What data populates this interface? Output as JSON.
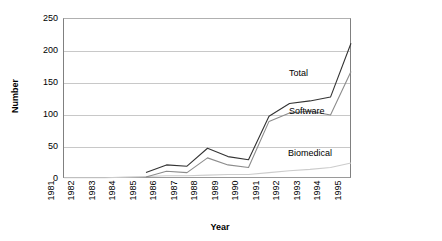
{
  "chart_data": {
    "type": "line",
    "title": "",
    "xlabel": "Year",
    "ylabel": "Number",
    "x": [
      1981,
      1982,
      1983,
      1984,
      1985,
      1986,
      1987,
      1988,
      1989,
      1990,
      1991,
      1992,
      1993,
      1994,
      1995
    ],
    "xlim": [
      1981,
      1995
    ],
    "ylim": [
      0,
      250
    ],
    "yticks": [
      0,
      50,
      100,
      150,
      200,
      250
    ],
    "xticks": [
      "1981",
      "1982",
      "1983",
      "1984",
      "1985",
      "1986",
      "1987",
      "1988",
      "1989",
      "1990",
      "1991",
      "1992",
      "1993",
      "1994",
      "1995"
    ],
    "grid": true,
    "legend_position": "in-plot annotations at right",
    "series": [
      {
        "name": "Total",
        "color": "#333333",
        "values": [
          null,
          null,
          null,
          null,
          10,
          22,
          20,
          48,
          35,
          30,
          98,
          118,
          122,
          128,
          212
        ]
      },
      {
        "name": "Software",
        "color": "#8c8c8c",
        "values": [
          null,
          null,
          null,
          null,
          3,
          12,
          10,
          33,
          22,
          18,
          90,
          103,
          106,
          100,
          168
        ]
      },
      {
        "name": "Biomedical",
        "color": "#cccccc",
        "values": [
          2,
          2,
          2,
          3,
          4,
          5,
          5,
          6,
          7,
          7,
          10,
          13,
          15,
          18,
          25
        ]
      }
    ],
    "annotations": [
      {
        "text": "Total",
        "x": 1992,
        "y": 160
      },
      {
        "text": "Software",
        "x": 1992,
        "y": 103
      },
      {
        "text": "Biomedical",
        "x": 1993,
        "y": 42
      }
    ]
  }
}
